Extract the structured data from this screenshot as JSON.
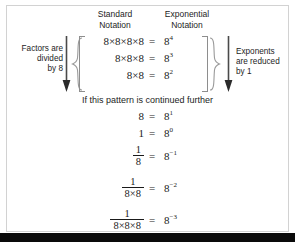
{
  "figure": {
    "headings": {
      "standard": "Standard\nNotation",
      "exponential": "Exponential\nNotation"
    },
    "annotations": {
      "left": "Factors are\ndivided\nby 8",
      "right": "Exponents\nare reduced\nby 1"
    },
    "middle_sentence": "If this pattern is continued further",
    "equations_top": [
      {
        "lhs": "8×8×8×8",
        "eq": "=",
        "base": "8",
        "exponent": "4"
      },
      {
        "lhs": "8×8×8",
        "eq": "=",
        "base": "8",
        "exponent": "3"
      },
      {
        "lhs": "8×8",
        "eq": "=",
        "base": "8",
        "exponent": "2"
      }
    ],
    "equations_bottom": [
      {
        "lhs": "8",
        "eq": "=",
        "base": "8",
        "exponent": "1"
      },
      {
        "lhs": "1",
        "eq": "=",
        "base": "8",
        "exponent": "0"
      },
      {
        "numerator": "1",
        "denominator": "8",
        "eq": "=",
        "base": "8",
        "exponent": "−1"
      },
      {
        "numerator": "1",
        "denominator": "8×8",
        "eq": "=",
        "base": "8",
        "exponent": "−2"
      },
      {
        "numerator": "1",
        "denominator": "8×8×8",
        "eq": "=",
        "base": "8",
        "exponent": "−3"
      }
    ],
    "colors": {
      "text": "#1a1a1a",
      "frame": "#d2d2d2",
      "brace": "#9a9a9a",
      "arrow": "#4a4a4a",
      "band": "#0a0a0a"
    }
  }
}
